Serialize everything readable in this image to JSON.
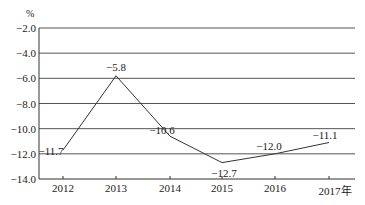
{
  "chart_data": {
    "type": "line",
    "title": "",
    "xlabel": "年",
    "ylabel": "%",
    "categories": [
      "2012",
      "2013",
      "2014",
      "2015",
      "2016",
      "2017"
    ],
    "x_tick_labels": [
      "2012",
      "2013",
      "2014",
      "2015",
      "2016",
      "2017年"
    ],
    "series": [
      {
        "name": "",
        "values": [
          -11.7,
          -5.8,
          -10.6,
          -12.7,
          -12.0,
          -11.1
        ]
      }
    ],
    "data_labels": [
      "−11.7",
      "−5.8",
      "−10.6",
      "−12.7",
      "−12.0",
      "−11.1"
    ],
    "y_ticks": [
      -2.0,
      -4.0,
      -6.0,
      -8.0,
      -10.0,
      -12.0,
      -14.0
    ],
    "y_tick_labels": [
      "−2.0",
      "−4.0",
      "−6.0",
      "−8.0",
      "−10.0",
      "−12.0",
      "−14.0"
    ],
    "ylim": [
      -14.0,
      -2.0
    ],
    "grid": true,
    "legend": "none"
  },
  "colors": {
    "line": "#333333",
    "grid": "#555555",
    "text": "#222222"
  }
}
